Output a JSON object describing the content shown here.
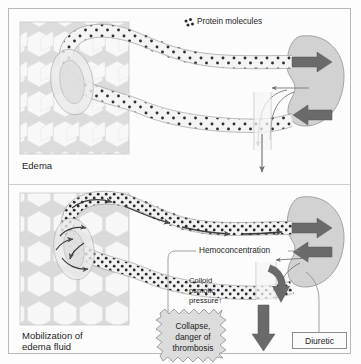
{
  "figure": {
    "background_color": "#fcfcfc",
    "border_color": "#b9b9b9",
    "width": 361,
    "height": 364
  },
  "legend": {
    "protein_label": "Protein molecules",
    "protein_dot_color": "#2b2b2b",
    "swatch_icon": "protein-dots-icon"
  },
  "panels": [
    {
      "id": "upper",
      "caption": "Edema",
      "tissue_label": "hexagonal-tissue-cells",
      "vessel_label": "capillary-loop",
      "organ_label": "kidney"
    },
    {
      "id": "lower",
      "caption": "Mobilization of\nedema fluid",
      "caption_line1": "Mobilization of",
      "caption_line2": "edema fluid",
      "tissue_label": "hexagonal-tissue-cells",
      "vessel_label": "capillary-loop",
      "organ_label": "kidney"
    }
  ],
  "annotations": {
    "hemoconcentration": "Hemoconcentration",
    "colloid_line1": "Colloid",
    "colloid_line2": "osmotic",
    "colloid_line3": "pressure↑",
    "burst_line1": "Collapse,",
    "burst_line2": "danger of",
    "burst_line3": "thrombosis",
    "diuretic": "Diuretic"
  },
  "colors": {
    "kidney_fill": "#d2d2d2",
    "kidney_stroke": "#9a9a9a",
    "vessel_fill": "#f4f4f4",
    "vessel_stroke": "#9e9e9e",
    "tissue_cell_fill": "#f7f7f7",
    "tissue_gap": "#d6d6d6",
    "arrow_dark": "#6a6a6a",
    "arrow_thin": "#6f6f6f",
    "burst_fill": "#dcdcdc",
    "burst_stroke": "#8f8f8f",
    "text": "#1d1d1d"
  },
  "arrow_names": {
    "kidney_in_upper": "blood-inflow-arrow",
    "kidney_out_upper": "blood-outflow-arrow",
    "urine_upper": "urine-output-arrow",
    "kidney_in_lower": "blood-inflow-arrow",
    "kidney_out_lower": "blood-outflow-arrow",
    "diuresis_curved": "diuresis-curved-arrow",
    "urine_lower": "increased-urine-output-arrow"
  }
}
